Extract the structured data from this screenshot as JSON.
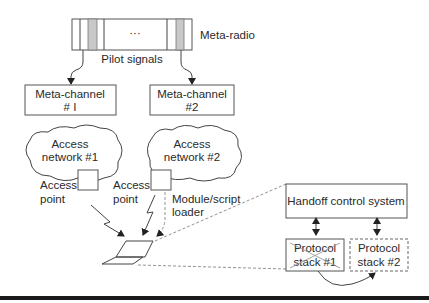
{
  "meta_radio": {
    "label": "Meta-radio",
    "ellipsis": "···",
    "pilot_signals_label": "Pilot signals"
  },
  "meta_channels": [
    {
      "line1": "Meta-channel",
      "line2": "# I"
    },
    {
      "line1": "Meta-channel",
      "line2": "#2"
    }
  ],
  "access_networks": [
    {
      "line1": "Access",
      "line2": "network #1",
      "ap_line1": "Access",
      "ap_line2": "point"
    },
    {
      "line1": "Access",
      "line2": "network #2",
      "ap_line1": "Access",
      "ap_line2": "point"
    }
  ],
  "module_loader": {
    "line1": "Module/script",
    "line2": "loader"
  },
  "detail": {
    "handoff_label": "Handoff control system",
    "stacks": [
      {
        "line1": "Protocol",
        "line2": "stack #1",
        "state": "crossed-out"
      },
      {
        "line1": "Protocol",
        "line2": "stack #2",
        "state": "dashed"
      }
    ]
  },
  "colors": {
    "line": "#444444",
    "pilot_fill": "#c8c8c8",
    "bottom_rule": "#1a1a1a"
  }
}
